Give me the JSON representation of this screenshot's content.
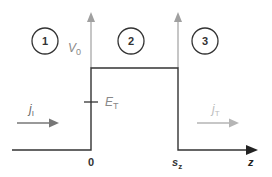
{
  "diagram": {
    "type": "potential-barrier",
    "regions": [
      {
        "id": "1",
        "label": "1"
      },
      {
        "id": "2",
        "label": "2"
      },
      {
        "id": "3",
        "label": "3"
      }
    ],
    "barrier_height_label": {
      "main": "V",
      "sub": "0"
    },
    "energy_label": {
      "main": "E",
      "sub": "T"
    },
    "incident_current_label": {
      "main": "j",
      "sub": "I"
    },
    "transmitted_current_label": {
      "main": "j",
      "sub": "T"
    },
    "x_ticks": [
      {
        "main": "0",
        "sub": ""
      },
      {
        "main": "s",
        "sub": "z"
      }
    ],
    "axis_label": "z",
    "colors": {
      "line": "#333333",
      "axis_arrow": "#999999",
      "label_gray": "#888888",
      "transmitted": "#b5b5b5",
      "incident_arrow": "#777777"
    }
  }
}
